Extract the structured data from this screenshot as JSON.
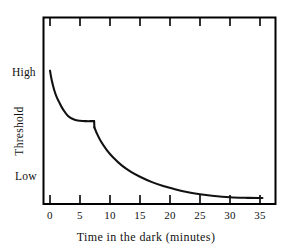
{
  "chart_data": {
    "type": "line",
    "title": "",
    "xlabel": "Time in the dark (minutes)",
    "ylabel": "Threshold",
    "xlim": [
      0,
      39
    ],
    "ylim": [
      0,
      1
    ],
    "grid": false,
    "legend": null,
    "x_ticks": [
      {
        "value": 0,
        "label": "0"
      },
      {
        "value": 5,
        "label": "5"
      },
      {
        "value": 10,
        "label": "10"
      },
      {
        "value": 15,
        "label": "15"
      },
      {
        "value": 20,
        "label": "20"
      },
      {
        "value": 25,
        "label": "25"
      },
      {
        "value": 30,
        "label": "30"
      },
      {
        "value": 35,
        "label": "35"
      }
    ],
    "y_ticks": [
      {
        "value": 0.73,
        "label": "High"
      },
      {
        "value": 0.17,
        "label": "Low"
      }
    ],
    "annotations": [
      {
        "name": "rod-cone-break",
        "x": 7.3,
        "note": "sharp discontinuity between cone branch and rod branch"
      }
    ],
    "series": [
      {
        "name": "cone branch",
        "x": [
          0.0,
          0.3,
          0.7,
          1.1,
          1.6,
          2.2,
          3.0,
          4.0,
          5.0,
          6.0,
          7.0,
          7.35
        ],
        "y": [
          0.713,
          0.66,
          0.61,
          0.573,
          0.54,
          0.505,
          0.471,
          0.452,
          0.445,
          0.443,
          0.443,
          0.443
        ]
      },
      {
        "name": "rod branch",
        "x": [
          7.4,
          7.8,
          8.5,
          9.5,
          10.5,
          12.0,
          13.5,
          15.0,
          17.0,
          19.0,
          21.0,
          23.0,
          25.0,
          27.0,
          30.0,
          33.0,
          35.4
        ],
        "y": [
          0.41,
          0.378,
          0.334,
          0.287,
          0.25,
          0.205,
          0.172,
          0.146,
          0.117,
          0.095,
          0.078,
          0.063,
          0.052,
          0.044,
          0.036,
          0.033,
          0.032
        ]
      }
    ]
  },
  "axes": {
    "x_title": "Time in the dark (minutes)",
    "y_title": "Threshold",
    "y_high_label": "High",
    "y_low_label": "Low",
    "tick_labels": [
      "0",
      "5",
      "10",
      "15",
      "20",
      "25",
      "30",
      "35"
    ]
  },
  "style": {
    "background": "#ffffff",
    "frame_color": "#000000",
    "curve_color": "#111111"
  }
}
